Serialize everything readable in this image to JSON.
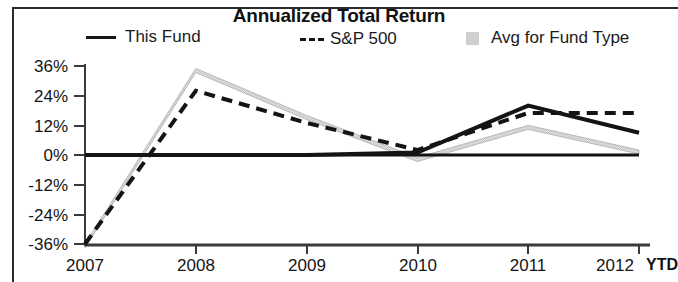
{
  "chart": {
    "title": "Annualized Total Return",
    "legend": [
      {
        "label": "This Fund",
        "marker": "solid-line",
        "color": "#161616"
      },
      {
        "label": "S&P 500",
        "marker": "dashed-line",
        "color": "#161616"
      },
      {
        "label": "Avg for Fund Type",
        "marker": "gray-square",
        "color": "#cfcfcf"
      }
    ],
    "ytd_note": "YTD"
  },
  "chart_data": {
    "type": "line",
    "title": "Annualized Total Return",
    "xlabel": "",
    "ylabel": "",
    "categories": [
      "2007",
      "2008",
      "2009",
      "2010",
      "2011",
      "2012"
    ],
    "x_tick_labels": [
      "2007",
      "2008",
      "2009",
      "2010",
      "2011",
      "2012"
    ],
    "x_axis_note": "YTD",
    "y_tick_labels": [
      "36%",
      "24%",
      "12%",
      "0%",
      "-12%",
      "-24%",
      "-36%"
    ],
    "y_tick_values": [
      36,
      24,
      12,
      0,
      -12,
      -24,
      -36
    ],
    "ylim": [
      -36,
      36
    ],
    "grid": false,
    "legend_position": "top",
    "series": [
      {
        "name": "This Fund",
        "style": "solid",
        "color": "#161616",
        "values": [
          0,
          0,
          0,
          1,
          20,
          9
        ]
      },
      {
        "name": "S&P 500",
        "style": "dashed",
        "color": "#161616",
        "values": [
          -36,
          26,
          13,
          2,
          17,
          17
        ]
      },
      {
        "name": "Avg for Fund Type",
        "style": "area",
        "color": "#d8d8d8",
        "values": [
          -36,
          35,
          16,
          -1,
          12,
          2
        ]
      }
    ]
  },
  "axis": {
    "y_ticks": [
      {
        "label": "36%",
        "value": 36
      },
      {
        "label": "24%",
        "value": 24
      },
      {
        "label": "12%",
        "value": 12
      },
      {
        "label": "0%",
        "value": 0
      },
      {
        "label": "-12%",
        "value": -12
      },
      {
        "label": "-24%",
        "value": -24
      },
      {
        "label": "-36%",
        "value": -36
      }
    ],
    "x_ticks": [
      {
        "label": "2007"
      },
      {
        "label": "2008"
      },
      {
        "label": "2009"
      },
      {
        "label": "2010"
      },
      {
        "label": "2011"
      },
      {
        "label": "2012"
      }
    ]
  }
}
